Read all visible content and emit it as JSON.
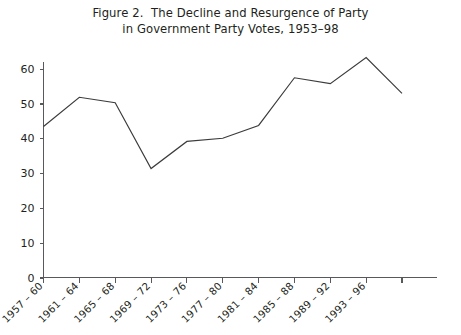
{
  "figure": {
    "title_line1": "Figure 2.  The Decline and Resurgence of Party",
    "title_line2": "in Government Party Votes, 1953–98"
  },
  "chart_data": {
    "type": "line",
    "title": "Figure 2.  The Decline and Resurgence of Party in Government Party Votes, 1953–98",
    "xlabel": "",
    "ylabel": "",
    "categories": [
      "1957 – 60",
      "1961 – 64",
      "1965 – 68",
      "1969 – 72",
      "1973 – 76",
      "1977 – 80",
      "1981 – 84",
      "1985 – 88",
      "1989 – 92",
      "1993 – 96",
      ""
    ],
    "values": [
      43.4,
      51.8,
      50.2,
      31.3,
      39.1,
      40.0,
      43.7,
      57.4,
      55.7,
      63.2,
      52.9
    ],
    "series": [
      {
        "name": "Government party votes",
        "values": [
          43.4,
          51.8,
          50.2,
          31.3,
          39.1,
          40.0,
          43.7,
          57.4,
          55.7,
          63.2,
          52.9
        ]
      }
    ],
    "ytick_labels": [
      "0",
      "10",
      "20",
      "30",
      "40",
      "50",
      "60"
    ],
    "ytick_values": [
      0,
      10,
      20,
      30,
      40,
      50,
      60
    ],
    "ylim": [
      0,
      68
    ],
    "grid": false,
    "legend": false,
    "line_color": "#3b3b3d",
    "axis_color": "#58595b",
    "background_color": "#ffffff",
    "xtick_label_rotation": -45
  }
}
